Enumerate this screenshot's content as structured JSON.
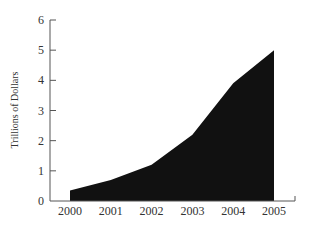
{
  "chart_data": {
    "type": "area",
    "title": "",
    "xlabel": "",
    "ylabel": "Trillions of Dollars",
    "categories": [
      "2000",
      "2001",
      "2002",
      "2003",
      "2004",
      "2005"
    ],
    "x": [
      2000,
      2001,
      2002,
      2003,
      2004,
      2005
    ],
    "values": [
      0.35,
      0.7,
      1.2,
      2.2,
      3.9,
      5.0
    ],
    "series": [
      {
        "name": "Trillions of Dollars",
        "values": [
          0.35,
          0.7,
          1.2,
          2.2,
          3.9,
          5.0
        ],
        "color": "#111111"
      }
    ],
    "ylim": [
      0,
      6
    ],
    "yticks": [
      0,
      1,
      2,
      3,
      4,
      5,
      6
    ],
    "grid": false,
    "legend": null
  }
}
